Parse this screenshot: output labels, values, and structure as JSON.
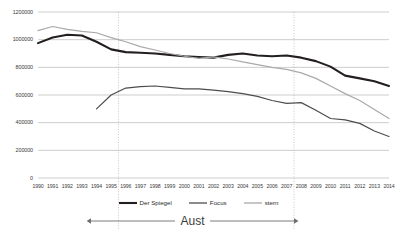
{
  "chart_data": {
    "type": "line",
    "title": "",
    "subtitle": "",
    "xlabel": "",
    "ylabel": "",
    "grid": true,
    "legend_position": "bottom",
    "xlim": [
      1990,
      2014
    ],
    "ylim": [
      0,
      1200000
    ],
    "y_ticks": [
      0,
      200000,
      400000,
      600000,
      800000,
      1000000,
      1200000
    ],
    "y_tick_labels": [
      "0",
      "200000",
      "400000",
      "600000",
      "800000",
      "1000000",
      "1200000"
    ],
    "categories": [
      1990,
      1991,
      1992,
      1993,
      1994,
      1995,
      1996,
      1997,
      1998,
      1999,
      2000,
      2001,
      2002,
      2003,
      2004,
      2005,
      2006,
      2007,
      2008,
      2009,
      2010,
      2011,
      2012,
      2013,
      2014
    ],
    "x_tick_labels": [
      "1990",
      "1991",
      "1992",
      "1993",
      "1994",
      "1995",
      "1996",
      "1997",
      "1998",
      "1999",
      "2000",
      "2001",
      "2002",
      "2003",
      "2004",
      "2005",
      "2006",
      "2007",
      "2008",
      "2009",
      "2010",
      "2011",
      "2012",
      "2013",
      "2014"
    ],
    "series": [
      {
        "name": "Der Spiegel",
        "color": "#231f20",
        "width": 2.1,
        "values": [
          975000,
          1015000,
          1035000,
          1030000,
          985000,
          930000,
          910000,
          905000,
          900000,
          890000,
          880000,
          875000,
          870000,
          890000,
          900000,
          885000,
          880000,
          885000,
          870000,
          845000,
          805000,
          740000,
          720000,
          700000,
          665000
        ]
      },
      {
        "name": "Focus",
        "color": "#4d4d4d",
        "width": 1.2,
        "values": [
          null,
          null,
          null,
          null,
          500000,
          600000,
          650000,
          660000,
          665000,
          655000,
          645000,
          645000,
          635000,
          625000,
          610000,
          590000,
          560000,
          540000,
          545000,
          490000,
          430000,
          420000,
          395000,
          340000,
          300000
        ]
      },
      {
        "name": "stern",
        "color": "#a9a9a9",
        "width": 1.2,
        "values": [
          1065000,
          1095000,
          1075000,
          1060000,
          1050000,
          1015000,
          985000,
          950000,
          925000,
          900000,
          880000,
          865000,
          875000,
          860000,
          840000,
          820000,
          800000,
          785000,
          760000,
          720000,
          665000,
          610000,
          560000,
          495000,
          430000
        ]
      }
    ],
    "reference_lines": [
      {
        "type": "vertical",
        "x": 1995.5,
        "style": "dotted"
      },
      {
        "type": "vertical",
        "x": 2007.5,
        "style": "dotted"
      }
    ],
    "annotations": [
      {
        "text": "Aust",
        "type": "span-arrow",
        "from": 1995.5,
        "to": 2007.5
      }
    ]
  },
  "legend": {
    "items": [
      {
        "label": "Der Spiegel"
      },
      {
        "label": "Focus"
      },
      {
        "label": "stern"
      }
    ]
  }
}
